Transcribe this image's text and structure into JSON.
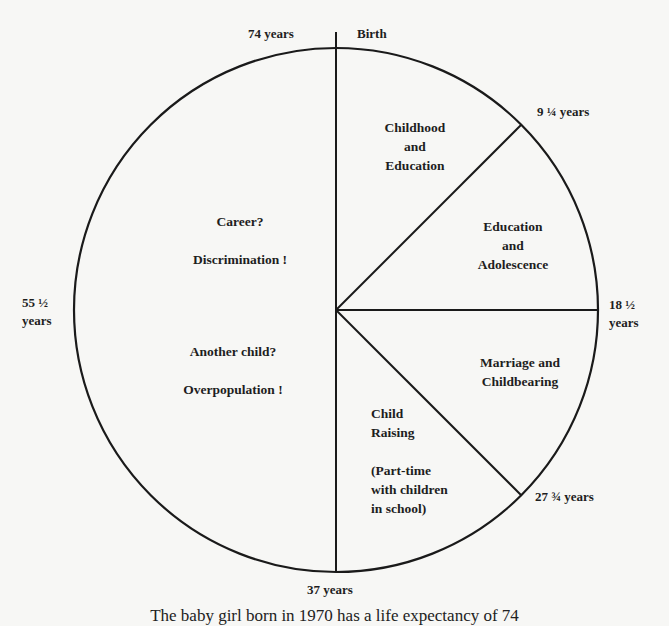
{
  "diagram": {
    "type": "life-cycle-pie",
    "total_years": 74,
    "boundaries": [
      {
        "label": "Birth",
        "years": 0
      },
      {
        "label": "9 ¼ years",
        "years": 9.25
      },
      {
        "label": "18 ½ years",
        "years": 18.5
      },
      {
        "label": "27 ¾ years",
        "years": 27.75
      },
      {
        "label": "37 years",
        "years": 37
      },
      {
        "label": "55 ½ years",
        "years": 55.5
      },
      {
        "label": "74 years",
        "years": 74
      }
    ],
    "top_left_label": "74 years",
    "top_right_label": "Birth",
    "right_upper_label": "9 ¼ years",
    "right_label_line1": "18 ½",
    "right_label_line2": "years",
    "right_lower_label": "27 ¾ years",
    "bottom_label": "37 years",
    "left_label_line1": "55 ½",
    "left_label_line2": "years",
    "segments": [
      {
        "name": "childhood",
        "line1": "Childhood",
        "line2": "and",
        "line3": "Education"
      },
      {
        "name": "adolescence",
        "line1": "Education",
        "line2": "and",
        "line3": "Adolescence"
      },
      {
        "name": "marriage",
        "line1": "Marriage and",
        "line2": "Childbearing"
      },
      {
        "name": "child-raising",
        "line1": "Child",
        "line2": "Raising",
        "line3": "(Part-time",
        "line4": "with children",
        "line5": "in school)"
      },
      {
        "name": "left-half",
        "line1": "Career?",
        "line2": "Discrimination !",
        "line3": "Another child?",
        "line4": "Overpopulation !"
      }
    ],
    "caption": "The baby girl born in 1970 has a life expectancy of 74"
  }
}
